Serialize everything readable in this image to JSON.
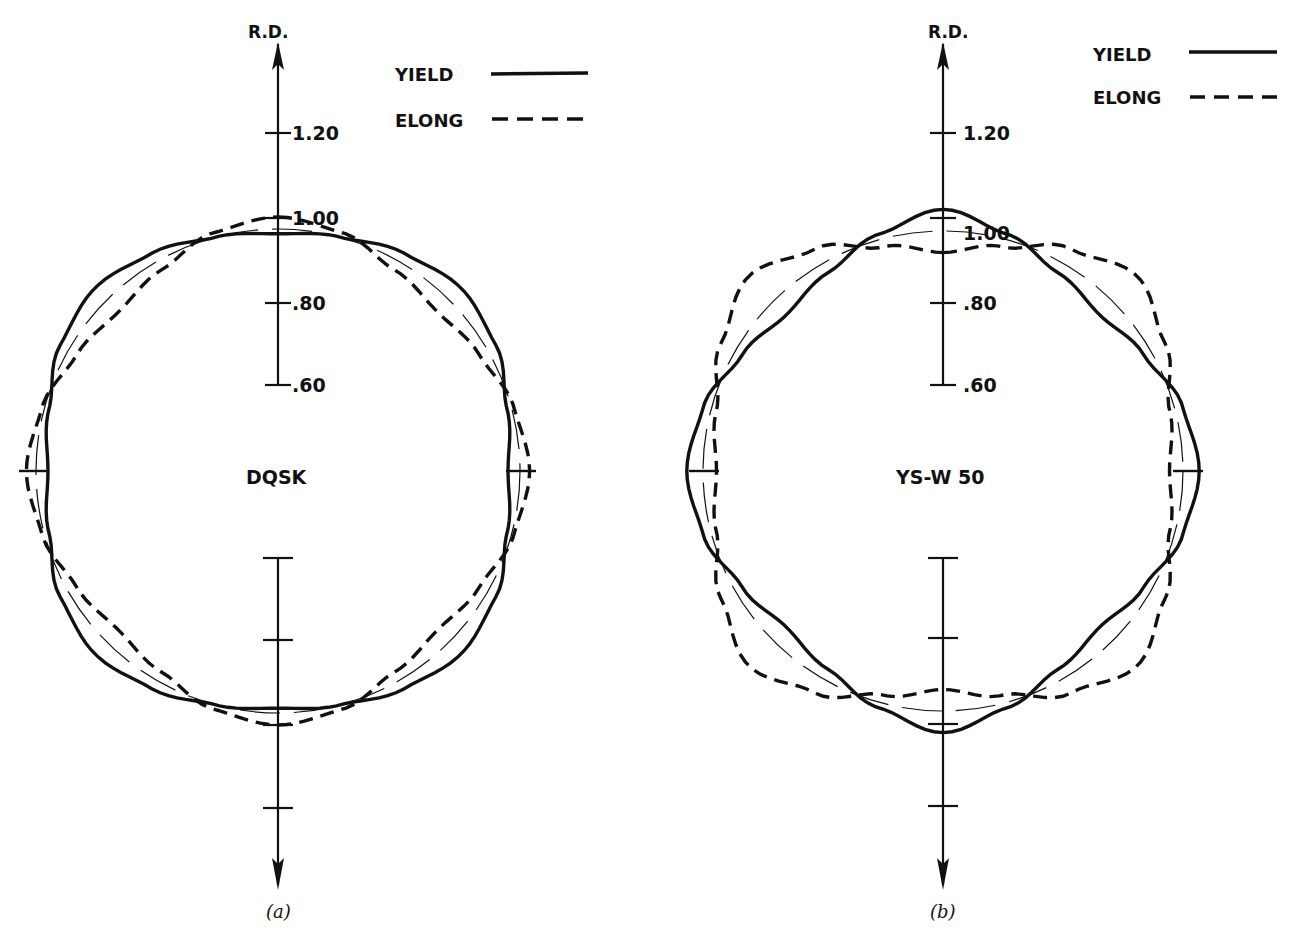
{
  "figure": {
    "caption_a": "(a)",
    "caption_b": "(b)",
    "axis_label": "R.D.",
    "tick_labels": [
      "1.20",
      "1.00",
      ".80",
      ".60"
    ],
    "legend": {
      "yield_label": "YIELD",
      "elong_label": "ELONG"
    },
    "colors": {
      "ink": "#111111",
      "background": "#ffffff"
    }
  },
  "chart_data": [
    {
      "type": "polar-line",
      "title": "DQSK",
      "caption": "(a)",
      "axis_label": "R.D.",
      "radial_ticks": [
        1.2,
        1.0,
        0.8,
        0.6
      ],
      "legend": [
        {
          "name": "YIELD",
          "style": "solid"
        },
        {
          "name": "ELONG",
          "style": "dashed"
        }
      ],
      "reference_circle": {
        "style": "thin long-dash",
        "value": 1.0
      },
      "series": [
        {
          "name": "YIELD",
          "description": "rounded-square shape, flat along R.D. (~0.95) and transverse (~1.0), corners bulged at ~45°",
          "angles_deg": [
            0,
            15,
            30,
            45,
            60,
            75,
            90
          ],
          "values": [
            0.98,
            1.0,
            1.04,
            1.07,
            1.04,
            0.98,
            0.95
          ]
        },
        {
          "name": "ELONG",
          "description": "max along R.D. (~1.04) and transverse (~1.05), min at ~45°",
          "angles_deg": [
            0,
            15,
            30,
            45,
            60,
            75,
            90
          ],
          "values": [
            1.05,
            1.02,
            0.96,
            0.93,
            0.96,
            1.01,
            1.04
          ]
        }
      ]
    },
    {
      "type": "polar-line",
      "title": "YS-W 50",
      "caption": "(b)",
      "axis_label": "R.D.",
      "radial_ticks": [
        1.2,
        1.0,
        0.8,
        0.6
      ],
      "legend": [
        {
          "name": "YIELD",
          "style": "solid"
        },
        {
          "name": "ELONG",
          "style": "dashed"
        }
      ],
      "reference_circle": {
        "style": "thin long-dash",
        "value": 1.0
      },
      "series": [
        {
          "name": "YIELD",
          "description": "six-lobed shape, peaks at 0°, 90°, 180°, 270° (~1.06-1.08), dips at ~45°",
          "angles_deg": [
            0,
            15,
            30,
            45,
            60,
            75,
            90
          ],
          "values": [
            1.08,
            1.02,
            0.96,
            0.93,
            0.97,
            1.03,
            1.06
          ]
        },
        {
          "name": "ELONG",
          "description": "square-like shape, min along R.D. (~0.95) and transverse (~0.92), max at ~45° (~1.13)",
          "angles_deg": [
            0,
            15,
            30,
            45,
            60,
            75,
            90
          ],
          "values": [
            0.92,
            0.97,
            1.06,
            1.13,
            1.06,
            0.98,
            0.95
          ]
        }
      ]
    }
  ]
}
